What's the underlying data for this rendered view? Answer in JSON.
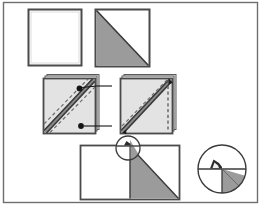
{
  "figure": {
    "canvas": {
      "width": 262,
      "height": 213
    },
    "colors": {
      "background": "#ffffff",
      "outline": "#4a4a4a",
      "outline_dark": "#2b2b2b",
      "fabric_light": "#e3e3e3",
      "fabric_gray": "#9b9b9b",
      "seam": "#555555",
      "dash": "#777777",
      "frame": "#6e6e6e"
    },
    "frame": {
      "x": 3,
      "y": 2,
      "width": 255,
      "height": 201,
      "label": "outer-frame"
    }
  },
  "steps": [
    {
      "id": "step-1",
      "name": "plain-square",
      "label": "Plain square",
      "shape": "square",
      "x": 28,
      "y": 9,
      "width": 54,
      "height": 57,
      "fill": "#ffffff",
      "triangle": null
    },
    {
      "id": "step-2",
      "name": "square-with-shaded-triangle",
      "label": "Square with shaded lower-left triangle",
      "shape": "square",
      "x": 95,
      "y": 9,
      "width": 55,
      "height": 58,
      "fill": "#ffffff",
      "triangle": {
        "fill": "#9b9b9b",
        "corners": "top-left, bottom-left, bottom-right"
      }
    },
    {
      "id": "step-3",
      "name": "folded-square-marked-left",
      "label": "Folded square with marked stitch points",
      "shape": "stacked-square",
      "x": 43,
      "y": 76,
      "width": 55,
      "height": 58,
      "fill": "#e3e3e3",
      "seam": {
        "from": "bottom-left",
        "to": "top-right",
        "style": "solid-double"
      },
      "dashes": 2,
      "markers": [
        {
          "id": "marker-top",
          "cx": 80,
          "cy": 88,
          "leader_to_x": 110
        },
        {
          "id": "marker-bottom",
          "cx": 81,
          "cy": 126,
          "leader_to_x": 110
        }
      ]
    },
    {
      "id": "step-4",
      "name": "folded-square-cut-right",
      "label": "Folded square with trim line at right edge",
      "shape": "stacked-square",
      "x": 120,
      "y": 76,
      "width": 55,
      "height": 58,
      "fill": "#e3e3e3",
      "seam": {
        "from": "bottom-left",
        "to": "top-right",
        "style": "solid-arrow"
      },
      "dashes": 1,
      "trim_line": {
        "orientation": "vertical",
        "x": 168,
        "style": "dashed"
      }
    },
    {
      "id": "step-5",
      "name": "opened-rectangle",
      "label": "Opened rectangle with shaded triangle",
      "shape": "rectangle",
      "x": 80,
      "y": 145,
      "width": 100,
      "height": 55,
      "fill": "#ffffff",
      "center_line_x": 130,
      "triangle": {
        "fill": "#9b9b9b",
        "corners": "top-center, bottom-center, bottom-right"
      }
    }
  ],
  "callouts": [
    {
      "id": "callout-small",
      "name": "detail-circle-small",
      "label": "Detail region marker",
      "cx": 128,
      "cy": 148,
      "r": 12
    },
    {
      "id": "callout-large",
      "name": "detail-circle-magnified",
      "label": "Magnified detail of seam corner",
      "cx": 222,
      "cy": 169,
      "r": 24,
      "contents": {
        "horizontal_line": true,
        "vertical_line": true,
        "folded_tab": true,
        "shaded_wedge_fill": "#9b9b9b"
      }
    }
  ]
}
